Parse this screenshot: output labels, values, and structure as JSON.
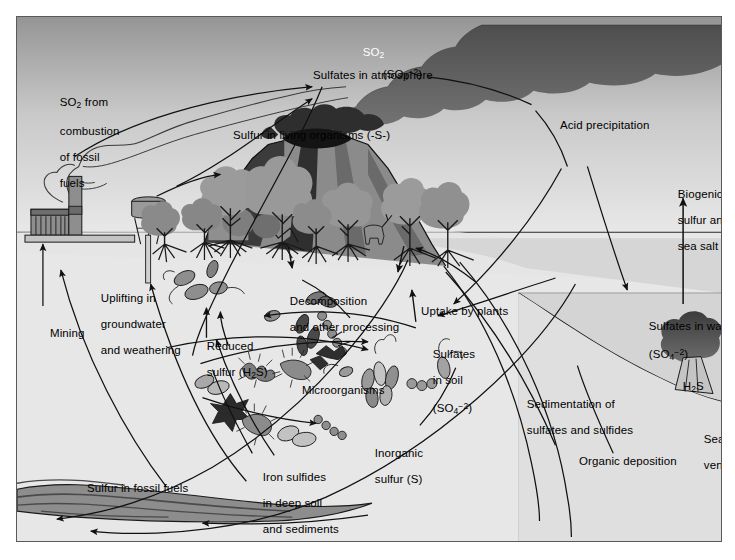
{
  "figure": {
    "frame_color": "#5a5a5a",
    "background": "#ffffff"
  },
  "colors": {
    "sky_top": "#9d9d9d",
    "sky_bottom": "#ececec",
    "soil": "#e7e7e7",
    "water": "#a9a9a9",
    "smoke_dark": "#6e6e6e",
    "smoke_darker": "#5a5a5a",
    "vegetation": "#9a9a9a",
    "vegetation_dark": "#7b7b7b",
    "volcano_dark": "#3a3a3a",
    "volcano_mid": "#7d7d7d",
    "coal": "#8d8d8d",
    "outline": "#1a1a1a"
  },
  "labels": {
    "so2_cloud": "SO2",
    "so2_cloud_formula": {
      "base": "SO",
      "sub": "2"
    },
    "sulfate_ion_atmosphere": {
      "open": "(SO",
      "sub": "4",
      "sup": "−2",
      "close": ")"
    },
    "sulfates_in_atmosphere": "Sulfates in atmosphere",
    "so2_from_combustion": "SO2 from\ncombustion\nof fossil\nfuels",
    "so2_from_combustion_lines": [
      "SO",
      "2",
      " from",
      "combustion",
      "of fossil",
      "fuels"
    ],
    "acid_precipitation": "Acid precipitation",
    "biogenic_sulfur": "Biogenic\nsulfur and\nsea salt",
    "biogenic_sulfur_lines": [
      "Biogenic",
      "sulfur and",
      "sea salt"
    ],
    "sulfur_in_living_organisms": "Sulfur in living organisms (-S-)",
    "sulfates_in_water": "Sulfates in water",
    "sulfates_in_water_formula": {
      "open": "(SO",
      "sub": "4",
      "sup": "−2",
      "close": ")"
    },
    "h2s_ocean": {
      "base1": "H",
      "sub": "2",
      "base2": "S"
    },
    "seafloor_vent": "Seafloor\nvent",
    "seafloor_vent_lines": [
      "Seafloor",
      "vent"
    ],
    "uplifting": "Uplifting in\ngroundwater\nand weathering",
    "uplifting_lines": [
      "Uplifting in",
      "groundwater",
      "and weathering"
    ],
    "mining": "Mining",
    "decomposition": "Decomposition\nand other processing",
    "decomposition_lines": [
      "Decomposition",
      "and other processing"
    ],
    "uptake_by_plants": "Uptake by plants",
    "reduced_sulfur": "Reduced\nsulfur (H2S)",
    "reduced_sulfur_line1": "Reduced",
    "reduced_sulfur_line2_pre": "sulfur (H",
    "reduced_sulfur_line2_sub": "2",
    "reduced_sulfur_line2_post": "S)",
    "sulfates_in_soil_line1": "Sulfates",
    "sulfates_in_soil_line2": "in soil",
    "sulfates_in_soil_formula": {
      "open": "(SO",
      "sub": "4",
      "sup": "−2",
      "close": ")"
    },
    "microorganisms": "Microorganisms",
    "inorganic_sulfur": "Inorganic\nsulfur (S)",
    "inorganic_sulfur_lines": [
      "Inorganic",
      "sulfur (S)"
    ],
    "iron_sulfides": "Iron sulfides\nin deep soil\nand sediments",
    "iron_sulfides_lines": [
      "Iron sulfides",
      "in deep soil",
      "and sediments"
    ],
    "sulfur_in_fossil_fuels": "Sulfur in fossil fuels",
    "sedimentation": "Sedimentation of\nsulfates and sulfides",
    "sedimentation_lines": [
      "Sedimentation of",
      "sulfates and sulfides"
    ],
    "organic_deposition": "Organic deposition"
  },
  "scene_objects": {
    "factory": "factory-with-smokestack",
    "water_tower": "water-tower",
    "forest": "forest-of-trees",
    "deer": "deer",
    "volcano": "erupting-volcano",
    "coal_seam": "fossil-fuel-deposit",
    "hydrothermal_vent": "seafloor-hydrothermal-vent",
    "microbes": "soil-microorganisms"
  },
  "process_flows": [
    {
      "name": "so2-combustion-to-atmosphere",
      "from": "factory",
      "to": "sulfates-in-atmosphere"
    },
    {
      "name": "volcanic-so2-to-atmosphere",
      "from": "volcano",
      "to": "so2-cloud"
    },
    {
      "name": "acid-precipitation",
      "from": "so2-cloud",
      "to": "sulfates-in-soil"
    },
    {
      "name": "acid-precipitation-to-water",
      "from": "so2-cloud",
      "to": "sulfates-in-water"
    },
    {
      "name": "biogenic-sulfur-sea-salt",
      "from": "sulfates-in-water",
      "to": "atmosphere"
    },
    {
      "name": "uptake-by-plants",
      "from": "sulfates-in-soil",
      "to": "living-organisms"
    },
    {
      "name": "decomposition",
      "from": "living-organisms",
      "to": "reduced-sulfur"
    },
    {
      "name": "microorganisms-oxidation",
      "from": "reduced-sulfur",
      "to": "sulfates-in-soil"
    },
    {
      "name": "inorganic-sulfur-conversion",
      "from": "reduced-sulfur",
      "to": "inorganic-sulfur"
    },
    {
      "name": "iron-sulfides-formation",
      "from": "reduced-sulfur",
      "to": "iron-sulfides"
    },
    {
      "name": "mining",
      "from": "fossil-fuels",
      "to": "factory"
    },
    {
      "name": "uplifting-groundwater-weathering",
      "from": "deep-soil",
      "to": "surface"
    },
    {
      "name": "sedimentation",
      "from": "water",
      "to": "sediments"
    },
    {
      "name": "organic-deposition",
      "from": "water",
      "to": "sediments"
    }
  ]
}
